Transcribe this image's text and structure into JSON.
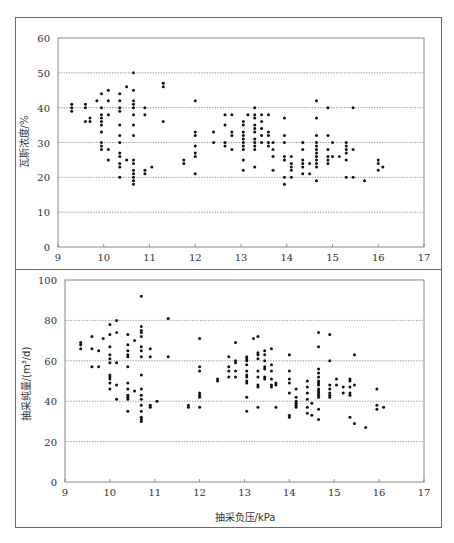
{
  "chart_data": [
    {
      "type": "scatter",
      "title": "",
      "xlabel": "",
      "ylabel": "瓦斯浓度/%",
      "xlim": [
        9,
        17
      ],
      "ylim": [
        0,
        60
      ],
      "xticks": [
        9,
        10,
        11,
        12,
        13,
        14,
        15,
        16,
        17
      ],
      "yticks": [
        0,
        10,
        20,
        30,
        40,
        50,
        60
      ],
      "grid": "horizontal dotted",
      "legend": "none",
      "points": [
        [
          9.3,
          41
        ],
        [
          9.3,
          40
        ],
        [
          9.3,
          39
        ],
        [
          9.6,
          41
        ],
        [
          9.6,
          40
        ],
        [
          9.6,
          36
        ],
        [
          9.7,
          37
        ],
        [
          9.7,
          36
        ],
        [
          9.85,
          42
        ],
        [
          9.95,
          44
        ],
        [
          9.95,
          40
        ],
        [
          9.95,
          38
        ],
        [
          9.95,
          37
        ],
        [
          9.95,
          36
        ],
        [
          9.95,
          35
        ],
        [
          9.95,
          33
        ],
        [
          9.95,
          30
        ],
        [
          9.95,
          29
        ],
        [
          9.95,
          28
        ],
        [
          10.1,
          45
        ],
        [
          10.1,
          42
        ],
        [
          10.1,
          38
        ],
        [
          10.1,
          28
        ],
        [
          10.1,
          25
        ],
        [
          10.35,
          44
        ],
        [
          10.35,
          42
        ],
        [
          10.35,
          40
        ],
        [
          10.35,
          39
        ],
        [
          10.35,
          35
        ],
        [
          10.35,
          32
        ],
        [
          10.35,
          30
        ],
        [
          10.35,
          27
        ],
        [
          10.35,
          26
        ],
        [
          10.35,
          24
        ],
        [
          10.35,
          23
        ],
        [
          10.35,
          20
        ],
        [
          10.5,
          46
        ],
        [
          10.5,
          25
        ],
        [
          10.65,
          50
        ],
        [
          10.65,
          45
        ],
        [
          10.65,
          42
        ],
        [
          10.65,
          41
        ],
        [
          10.65,
          40
        ],
        [
          10.65,
          38
        ],
        [
          10.65,
          35
        ],
        [
          10.65,
          32
        ],
        [
          10.65,
          25
        ],
        [
          10.65,
          24
        ],
        [
          10.65,
          22
        ],
        [
          10.65,
          21
        ],
        [
          10.65,
          20
        ],
        [
          10.65,
          19
        ],
        [
          10.65,
          18
        ],
        [
          10.9,
          40
        ],
        [
          10.9,
          38
        ],
        [
          10.9,
          22
        ],
        [
          10.9,
          21
        ],
        [
          11.05,
          23
        ],
        [
          11.3,
          47
        ],
        [
          11.3,
          46
        ],
        [
          11.3,
          36
        ],
        [
          11.75,
          25
        ],
        [
          11.75,
          24
        ],
        [
          12.0,
          42
        ],
        [
          12.0,
          33
        ],
        [
          12.0,
          32
        ],
        [
          12.0,
          29
        ],
        [
          12.0,
          27
        ],
        [
          12.0,
          26
        ],
        [
          12.0,
          21
        ],
        [
          12.4,
          33
        ],
        [
          12.4,
          30
        ],
        [
          12.65,
          38
        ],
        [
          12.65,
          35
        ],
        [
          12.65,
          30
        ],
        [
          12.65,
          29
        ],
        [
          12.8,
          38
        ],
        [
          12.8,
          33
        ],
        [
          12.8,
          32
        ],
        [
          12.8,
          28
        ],
        [
          13.05,
          36
        ],
        [
          13.05,
          35
        ],
        [
          13.05,
          33
        ],
        [
          13.05,
          32
        ],
        [
          13.05,
          31
        ],
        [
          13.05,
          30
        ],
        [
          13.05,
          29
        ],
        [
          13.05,
          28
        ],
        [
          13.05,
          25
        ],
        [
          13.05,
          22
        ],
        [
          13.15,
          38
        ],
        [
          13.3,
          40
        ],
        [
          13.3,
          38
        ],
        [
          13.3,
          37
        ],
        [
          13.3,
          35
        ],
        [
          13.3,
          34
        ],
        [
          13.3,
          33
        ],
        [
          13.3,
          31
        ],
        [
          13.3,
          30
        ],
        [
          13.3,
          29
        ],
        [
          13.3,
          28
        ],
        [
          13.3,
          23
        ],
        [
          13.45,
          38
        ],
        [
          13.45,
          36
        ],
        [
          13.45,
          34
        ],
        [
          13.45,
          32
        ],
        [
          13.45,
          30
        ],
        [
          13.6,
          38
        ],
        [
          13.6,
          33
        ],
        [
          13.6,
          32
        ],
        [
          13.6,
          30
        ],
        [
          13.6,
          29
        ],
        [
          13.7,
          30
        ],
        [
          13.7,
          28
        ],
        [
          13.7,
          26
        ],
        [
          13.7,
          22
        ],
        [
          13.95,
          37
        ],
        [
          13.95,
          32
        ],
        [
          13.95,
          30
        ],
        [
          13.95,
          26
        ],
        [
          13.95,
          25
        ],
        [
          13.95,
          20
        ],
        [
          13.95,
          18
        ],
        [
          14.1,
          26
        ],
        [
          14.1,
          24
        ],
        [
          14.1,
          23
        ],
        [
          14.1,
          22
        ],
        [
          14.1,
          20
        ],
        [
          14.35,
          30
        ],
        [
          14.35,
          28
        ],
        [
          14.35,
          25
        ],
        [
          14.35,
          24
        ],
        [
          14.35,
          23
        ],
        [
          14.35,
          21
        ],
        [
          14.5,
          24
        ],
        [
          14.5,
          21
        ],
        [
          14.65,
          42
        ],
        [
          14.65,
          37
        ],
        [
          14.65,
          32
        ],
        [
          14.65,
          30
        ],
        [
          14.65,
          29
        ],
        [
          14.65,
          28
        ],
        [
          14.65,
          27
        ],
        [
          14.65,
          26
        ],
        [
          14.65,
          25
        ],
        [
          14.65,
          24
        ],
        [
          14.65,
          23
        ],
        [
          14.65,
          19
        ],
        [
          14.9,
          40
        ],
        [
          14.9,
          32
        ],
        [
          14.9,
          28
        ],
        [
          14.9,
          26
        ],
        [
          14.9,
          25
        ],
        [
          14.9,
          24
        ],
        [
          15.0,
          30
        ],
        [
          15.0,
          26
        ],
        [
          15.15,
          26
        ],
        [
          15.3,
          30
        ],
        [
          15.3,
          29
        ],
        [
          15.3,
          28
        ],
        [
          15.3,
          27
        ],
        [
          15.3,
          25
        ],
        [
          15.3,
          20
        ],
        [
          15.45,
          40
        ],
        [
          15.45,
          28
        ],
        [
          15.45,
          20
        ],
        [
          15.7,
          19
        ],
        [
          16.0,
          25
        ],
        [
          16.0,
          24
        ],
        [
          16.0,
          22
        ],
        [
          16.1,
          23
        ]
      ]
    },
    {
      "type": "scatter",
      "title": "",
      "xlabel": "抽采负压/kPa",
      "ylabel": "抽采纯量/(m³/d)",
      "xlim": [
        9,
        17
      ],
      "ylim": [
        0,
        100
      ],
      "xticks": [
        9,
        10,
        11,
        12,
        13,
        14,
        15,
        16,
        17
      ],
      "yticks": [
        0,
        20,
        40,
        60,
        80,
        100
      ],
      "grid": "horizontal dotted",
      "legend": "none",
      "points": [
        [
          9.35,
          69
        ],
        [
          9.35,
          68
        ],
        [
          9.35,
          66
        ],
        [
          9.6,
          72
        ],
        [
          9.6,
          66
        ],
        [
          9.6,
          57
        ],
        [
          9.75,
          65
        ],
        [
          9.75,
          57
        ],
        [
          9.85,
          71
        ],
        [
          10.0,
          78
        ],
        [
          10.0,
          73
        ],
        [
          10.0,
          67
        ],
        [
          10.0,
          63
        ],
        [
          10.0,
          61
        ],
        [
          10.0,
          59
        ],
        [
          10.0,
          53
        ],
        [
          10.0,
          52
        ],
        [
          10.0,
          51
        ],
        [
          10.0,
          49
        ],
        [
          10.0,
          46
        ],
        [
          10.15,
          80
        ],
        [
          10.15,
          74
        ],
        [
          10.15,
          59
        ],
        [
          10.15,
          48
        ],
        [
          10.15,
          41
        ],
        [
          10.4,
          73
        ],
        [
          10.4,
          68
        ],
        [
          10.4,
          65
        ],
        [
          10.4,
          63
        ],
        [
          10.4,
          62
        ],
        [
          10.4,
          57
        ],
        [
          10.4,
          49
        ],
        [
          10.4,
          46
        ],
        [
          10.4,
          43
        ],
        [
          10.4,
          42
        ],
        [
          10.4,
          41
        ],
        [
          10.4,
          35
        ],
        [
          10.55,
          70
        ],
        [
          10.55,
          45
        ],
        [
          10.7,
          92
        ],
        [
          10.7,
          77
        ],
        [
          10.7,
          75
        ],
        [
          10.7,
          74
        ],
        [
          10.7,
          72
        ],
        [
          10.7,
          67
        ],
        [
          10.7,
          65
        ],
        [
          10.7,
          62
        ],
        [
          10.7,
          53
        ],
        [
          10.7,
          46
        ],
        [
          10.7,
          43
        ],
        [
          10.7,
          41
        ],
        [
          10.7,
          38
        ],
        [
          10.7,
          35
        ],
        [
          10.7,
          32
        ],
        [
          10.7,
          31
        ],
        [
          10.7,
          30
        ],
        [
          10.9,
          66
        ],
        [
          10.9,
          62
        ],
        [
          10.9,
          38
        ],
        [
          10.9,
          37
        ],
        [
          11.05,
          40
        ],
        [
          11.3,
          81
        ],
        [
          11.3,
          62
        ],
        [
          11.75,
          38
        ],
        [
          11.75,
          37
        ],
        [
          12.0,
          71
        ],
        [
          12.0,
          57
        ],
        [
          12.0,
          55
        ],
        [
          12.0,
          44
        ],
        [
          12.0,
          43
        ],
        [
          12.0,
          42
        ],
        [
          12.0,
          37
        ],
        [
          12.4,
          51
        ],
        [
          12.4,
          50
        ],
        [
          12.65,
          62
        ],
        [
          12.65,
          57
        ],
        [
          12.65,
          55
        ],
        [
          12.65,
          52
        ],
        [
          12.8,
          69
        ],
        [
          12.8,
          60
        ],
        [
          12.8,
          59
        ],
        [
          12.8,
          55
        ],
        [
          12.8,
          52
        ],
        [
          13.05,
          62
        ],
        [
          13.05,
          61
        ],
        [
          13.05,
          60
        ],
        [
          13.05,
          58
        ],
        [
          13.05,
          55
        ],
        [
          13.05,
          53
        ],
        [
          13.05,
          52
        ],
        [
          13.05,
          50
        ],
        [
          13.05,
          49
        ],
        [
          13.05,
          42
        ],
        [
          13.05,
          35
        ],
        [
          13.2,
          71
        ],
        [
          13.3,
          72
        ],
        [
          13.3,
          64
        ],
        [
          13.3,
          63
        ],
        [
          13.3,
          61
        ],
        [
          13.3,
          55
        ],
        [
          13.3,
          52
        ],
        [
          13.3,
          48
        ],
        [
          13.3,
          47
        ],
        [
          13.3,
          37
        ],
        [
          13.45,
          65
        ],
        [
          13.45,
          63
        ],
        [
          13.45,
          60
        ],
        [
          13.45,
          57
        ],
        [
          13.45,
          56
        ],
        [
          13.45,
          52
        ],
        [
          13.45,
          51
        ],
        [
          13.6,
          66
        ],
        [
          13.6,
          58
        ],
        [
          13.6,
          55
        ],
        [
          13.6,
          51
        ],
        [
          13.6,
          48
        ],
        [
          13.6,
          47
        ],
        [
          13.7,
          49
        ],
        [
          13.7,
          48
        ],
        [
          13.7,
          37
        ],
        [
          14.0,
          63
        ],
        [
          14.0,
          55
        ],
        [
          14.0,
          51
        ],
        [
          14.0,
          49
        ],
        [
          14.0,
          44
        ],
        [
          14.0,
          33
        ],
        [
          14.0,
          32
        ],
        [
          14.15,
          46
        ],
        [
          14.15,
          42
        ],
        [
          14.15,
          40
        ],
        [
          14.15,
          39
        ],
        [
          14.15,
          38
        ],
        [
          14.15,
          37
        ],
        [
          14.4,
          50
        ],
        [
          14.4,
          47
        ],
        [
          14.4,
          44
        ],
        [
          14.4,
          41
        ],
        [
          14.4,
          37
        ],
        [
          14.4,
          34
        ],
        [
          14.5,
          39
        ],
        [
          14.5,
          33
        ],
        [
          14.65,
          74
        ],
        [
          14.65,
          67
        ],
        [
          14.65,
          56
        ],
        [
          14.65,
          54
        ],
        [
          14.65,
          52
        ],
        [
          14.65,
          50
        ],
        [
          14.65,
          49
        ],
        [
          14.65,
          48
        ],
        [
          14.65,
          46
        ],
        [
          14.65,
          45
        ],
        [
          14.65,
          44
        ],
        [
          14.65,
          43
        ],
        [
          14.65,
          42
        ],
        [
          14.65,
          36
        ],
        [
          14.65,
          31
        ],
        [
          14.9,
          73
        ],
        [
          14.9,
          60
        ],
        [
          14.9,
          48
        ],
        [
          14.9,
          46
        ],
        [
          14.9,
          44
        ],
        [
          14.9,
          43
        ],
        [
          14.9,
          42
        ],
        [
          15.05,
          51
        ],
        [
          15.05,
          48
        ],
        [
          15.2,
          47
        ],
        [
          15.2,
          44
        ],
        [
          15.35,
          51
        ],
        [
          15.35,
          50
        ],
        [
          15.35,
          47
        ],
        [
          15.35,
          44
        ],
        [
          15.35,
          43
        ],
        [
          15.35,
          32
        ],
        [
          15.45,
          63
        ],
        [
          15.45,
          48
        ],
        [
          15.45,
          29
        ],
        [
          15.7,
          27
        ],
        [
          15.95,
          46
        ],
        [
          15.95,
          38
        ],
        [
          15.95,
          36
        ],
        [
          16.1,
          37
        ]
      ]
    }
  ],
  "charts": {
    "top": {
      "ylabel": "瓦斯浓度/%",
      "xticks": [
        "9",
        "10",
        "11",
        "12",
        "13",
        "14",
        "15",
        "16",
        "17"
      ],
      "yticks": [
        "0",
        "10",
        "20",
        "30",
        "40",
        "50",
        "60"
      ]
    },
    "bottom": {
      "ylabel": "抽采纯量/(m³/d)",
      "xlabel": "抽采负压/kPa",
      "xticks": [
        "9",
        "10",
        "11",
        "12",
        "13",
        "14",
        "15",
        "16",
        "17"
      ],
      "yticks": [
        "0",
        "20",
        "40",
        "60",
        "80",
        "100"
      ]
    }
  }
}
